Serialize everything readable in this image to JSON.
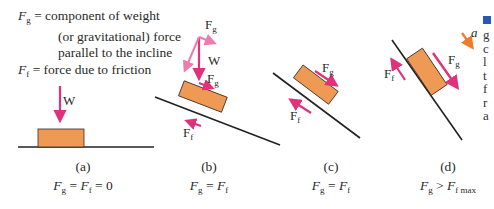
{
  "legend": {
    "fg_symbol": "F",
    "fg_sub": "g",
    "fg_line1": " = component of weight",
    "fg_line2": "(or gravitational) force",
    "fg_line3": "parallel to the incline",
    "ff_symbol": "F",
    "ff_sub": "f",
    "ff_line1": " = force due to friction"
  },
  "colors": {
    "force_arrow": "#e0327a",
    "weight_component_arrow": "#ee7aae",
    "acceleration_arrow": "#f07a28",
    "block_fill": "#ee9a55",
    "block_stroke": "#3a2a20",
    "surface": "#222222"
  },
  "panels": [
    {
      "id": "a",
      "label": "(a)",
      "equation": {
        "a": "F",
        "a_sub": "g",
        "op1": " = ",
        "b": "F",
        "b_sub": "f",
        "op2": " = 0"
      },
      "force_labels": {
        "w": "W"
      }
    },
    {
      "id": "b",
      "label": "(b)",
      "equation": {
        "a": "F",
        "a_sub": "g",
        "op1": " = ",
        "b": "F",
        "b_sub": "f"
      },
      "force_labels": {
        "fg_top": "F",
        "fg_top_sub": "g",
        "w": "W",
        "fg": "F",
        "fg_sub": "g",
        "ff": "F",
        "ff_sub": "f"
      }
    },
    {
      "id": "c",
      "label": "(c)",
      "equation": {
        "a": "F",
        "a_sub": "g",
        "op1": " = ",
        "b": "F",
        "b_sub": "f"
      },
      "force_labels": {
        "fg": "F",
        "fg_sub": "g",
        "ff": "F",
        "ff_sub": "f"
      }
    },
    {
      "id": "d",
      "label": "(d)",
      "equation": {
        "a": "F",
        "a_sub": "g",
        "op1": " > ",
        "b": "F",
        "b_sub": "f max"
      },
      "force_labels": {
        "fg": "F",
        "fg_sub": "g",
        "ff": "F",
        "ff_sub": "f",
        "a": "a"
      }
    }
  ],
  "right_edge_fragment": [
    "g",
    "c",
    "l",
    "t",
    "f",
    "r",
    "a"
  ]
}
